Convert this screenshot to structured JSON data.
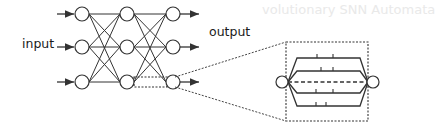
{
  "labels": {
    "input": "input",
    "output": "output"
  },
  "background_text": {
    "heading_fragment": "volutionary SNN Automata"
  },
  "network": {
    "layers": 3,
    "nodes_per_layer": 3,
    "connections": "fully-connected",
    "highlighted_edge": {
      "from": "layer2-node3",
      "to": "layer3-node3",
      "style": "dashed-box"
    }
  },
  "zoom_inset": {
    "description": "Magnified view of one connection showing multiple delayed synaptic paths",
    "paths": 5,
    "middle_path_style": "dashed",
    "ticks_per_path": [
      2,
      2,
      0,
      2,
      2
    ]
  },
  "colors": {
    "stroke": "#333333",
    "text": "#1a1a1a",
    "background": "#ffffff"
  }
}
